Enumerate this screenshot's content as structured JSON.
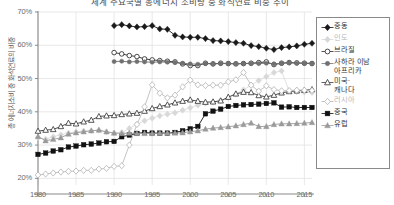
{
  "chart_data": {
    "type": "line",
    "title": "세계 주요국별 총에너지 소비량 중 화석연료 비중 추이",
    "xlabel": "",
    "ylabel": "총 에너지소비 중 화석연료의 비중",
    "xlim": [
      1980,
      2016
    ],
    "ylim": [
      0.18,
      0.7
    ],
    "ytick_labels": [
      "20%",
      "30%",
      "40%",
      "50%",
      "60%",
      "70%"
    ],
    "ytick_values": [
      20,
      30,
      40,
      50,
      60,
      70
    ],
    "xtick_labels": [
      "1980",
      "1985",
      "1990",
      "1995",
      "2000",
      "2005",
      "2010",
      "2015"
    ],
    "xtick_values": [
      1980,
      1985,
      1990,
      1995,
      2000,
      2005,
      2010,
      2015
    ],
    "grid": true,
    "legend_position": "right",
    "x": [
      1980,
      1981,
      1982,
      1983,
      1984,
      1985,
      1986,
      1987,
      1988,
      1989,
      1990,
      1991,
      1992,
      1993,
      1994,
      1995,
      1996,
      1997,
      1998,
      1999,
      2000,
      2001,
      2002,
      2003,
      2004,
      2005,
      2006,
      2007,
      2008,
      2009,
      2010,
      2011,
      2012,
      2013,
      2014,
      2015,
      2016
    ],
    "series": [
      {
        "name": "중동",
        "marker": "diamond-filled",
        "color": "#1a1a1a",
        "x": [
          1990,
          1991,
          1992,
          1993,
          1994,
          1995,
          1996,
          1997,
          1998,
          1999,
          2000,
          2001,
          2002,
          2003,
          2004,
          2005,
          2006,
          2007,
          2008,
          2009,
          2010,
          2011,
          2012,
          2013,
          2014,
          2015,
          2016
        ],
        "values": [
          65.9,
          66.2,
          65.8,
          65.5,
          65.6,
          65.9,
          64.9,
          64.8,
          63.0,
          62.5,
          62.4,
          62.4,
          62.0,
          61.4,
          61.3,
          61.1,
          60.8,
          60.6,
          59.9,
          59.6,
          59.1,
          58.7,
          59.3,
          59.5,
          59.8,
          60.3,
          60.6
        ]
      },
      {
        "name": "인도",
        "marker": "diamond-filled-light",
        "color": "#d8d8d8",
        "x": [
          1980,
          1981,
          1982,
          1983,
          1984,
          1985,
          1986,
          1987,
          1988,
          1989,
          1990,
          1991,
          1992,
          1993,
          1994,
          1995,
          1996,
          1997,
          1998,
          1999,
          2000,
          2001,
          2002,
          2003,
          2004,
          2005,
          2006,
          2007,
          2008,
          2009,
          2010,
          2011,
          2012,
          2013,
          2014,
          2015,
          2016
        ],
        "values": [
          32.2,
          31.8,
          32.5,
          33.1,
          33.6,
          34.0,
          34.2,
          34.3,
          34.4,
          33.9,
          33.6,
          33.8,
          35.0,
          36.3,
          37.3,
          38.1,
          38.8,
          39.3,
          39.7,
          40.5,
          41.2,
          42.0,
          42.6,
          42.9,
          43.4,
          44.2,
          45.3,
          46.6,
          48.0,
          49.4,
          50.6,
          51.8,
          52.3,
          46.2,
          46.0,
          45.9,
          45.8
        ]
      },
      {
        "name": "브라질",
        "marker": "circle-open",
        "color": "#2a2a2a",
        "x": [
          1990,
          1991,
          1992,
          1993,
          1994,
          1995,
          1996,
          1997,
          1998,
          1999,
          2000,
          2001,
          2002,
          2003,
          2004,
          2005,
          2006,
          2007,
          2008,
          2009,
          2010,
          2011,
          2012,
          2013,
          2014,
          2015,
          2016
        ],
        "values": [
          57.8,
          57.4,
          56.9,
          56.6,
          55.9,
          55.6,
          55.4,
          55.2,
          55.0,
          54.4,
          53.9,
          53.9,
          54.6,
          54.4,
          54.6,
          54.5,
          54.4,
          54.5,
          54.6,
          54.8,
          55.0,
          54.2,
          54.6,
          54.8,
          54.7,
          54.6,
          54.5
        ]
      },
      {
        "name": "사하라 이남\n아프리카",
        "marker": "circle-filled-gray",
        "color": "#707070",
        "x": [
          1990,
          1991,
          1992,
          1993,
          1994,
          1995,
          1996,
          1997,
          1998,
          1999,
          2000,
          2001,
          2002,
          2003,
          2004,
          2005,
          2006,
          2007,
          2008,
          2009,
          2010,
          2011,
          2012,
          2013,
          2014,
          2015,
          2016
        ],
        "values": [
          55.1,
          55.2,
          55.0,
          55.1,
          55.0,
          54.9,
          55.0,
          54.9,
          54.8,
          54.6,
          54.4,
          54.3,
          54.5,
          54.4,
          54.5,
          54.5,
          54.5,
          54.5,
          54.5,
          54.5,
          54.6,
          54.4,
          54.6,
          54.7,
          54.6,
          54.6,
          54.6
        ]
      },
      {
        "name": "미국·\n캐나다",
        "marker": "triangle-open",
        "color": "#3a3a3a",
        "x": [
          1980,
          1981,
          1982,
          1983,
          1984,
          1985,
          1986,
          1987,
          1988,
          1989,
          1990,
          1991,
          1992,
          1993,
          1994,
          1995,
          1996,
          1997,
          1998,
          1999,
          2000,
          2001,
          2002,
          2003,
          2004,
          2005,
          2006,
          2007,
          2008,
          2009,
          2010,
          2011,
          2012,
          2013,
          2014,
          2015,
          2016
        ],
        "values": [
          34.2,
          34.5,
          34.7,
          35.6,
          36.6,
          36.4,
          37.0,
          37.5,
          38.6,
          38.8,
          38.9,
          39.2,
          39.4,
          39.6,
          40.2,
          41.0,
          41.6,
          42.1,
          42.7,
          43.2,
          43.6,
          43.2,
          42.9,
          43.0,
          43.3,
          44.4,
          45.4,
          45.9,
          45.8,
          44.9,
          44.5,
          45.0,
          45.7,
          46.1,
          46.3,
          46.5,
          46.7
        ]
      },
      {
        "name": "러시아",
        "marker": "diamond-open",
        "color": "#b4b4b4",
        "x": [
          1980,
          1981,
          1982,
          1983,
          1984,
          1985,
          1986,
          1987,
          1988,
          1989,
          1990,
          1991,
          1992,
          1993,
          1994,
          1995,
          1996,
          1997,
          1998,
          1999,
          2000,
          2001,
          2002,
          2003,
          2004,
          2005,
          2006,
          2007,
          2008,
          2009,
          2010,
          2011,
          2012,
          2013,
          2014,
          2015,
          2016
        ],
        "values": [
          21.0,
          21.3,
          21.6,
          21.9,
          22.1,
          22.2,
          22.4,
          22.4,
          22.8,
          23.0,
          23.6,
          23.8,
          30.0,
          36.2,
          41.5,
          48.1,
          45.6,
          44.2,
          45.0,
          47.5,
          49.5,
          48.1,
          47.9,
          48.0,
          48.0,
          49.0,
          49.6,
          51.8,
          48.0,
          46.2,
          47.8,
          46.7,
          46.3,
          46.4,
          46.5,
          46.5,
          46.4
        ]
      },
      {
        "name": "중국",
        "marker": "square-filled",
        "color": "#111111",
        "x": [
          1980,
          1981,
          1982,
          1983,
          1984,
          1985,
          1986,
          1987,
          1988,
          1989,
          1990,
          1991,
          1992,
          1993,
          1994,
          1995,
          1996,
          1997,
          1998,
          1999,
          2000,
          2001,
          2002,
          2003,
          2004,
          2005,
          2006,
          2007,
          2008,
          2009,
          2010,
          2011,
          2012,
          2013,
          2014,
          2015,
          2016
        ],
        "values": [
          27.2,
          27.6,
          28.2,
          28.6,
          29.4,
          29.7,
          30.1,
          30.3,
          30.6,
          31.0,
          31.1,
          32.5,
          33.0,
          33.5,
          33.8,
          33.6,
          33.6,
          33.6,
          33.8,
          34.3,
          34.9,
          35.6,
          39.4,
          40.2,
          40.8,
          41.6,
          41.9,
          42.1,
          42.2,
          42.3,
          42.5,
          42.7,
          41.4,
          41.5,
          41.3,
          41.3,
          41.3
        ]
      },
      {
        "name": "유럽",
        "marker": "triangle-filled-gray",
        "color": "#9a9a9a",
        "x": [
          1980,
          1981,
          1982,
          1983,
          1984,
          1985,
          1986,
          1987,
          1988,
          1989,
          1990,
          1991,
          1992,
          1993,
          1994,
          1995,
          1996,
          1997,
          1998,
          1999,
          2000,
          2001,
          2002,
          2003,
          2004,
          2005,
          2006,
          2007,
          2008,
          2009,
          2010,
          2011,
          2012,
          2013,
          2014,
          2015,
          2016
        ],
        "values": [
          32.6,
          31.3,
          31.7,
          32.2,
          33.3,
          33.7,
          34.0,
          34.3,
          34.5,
          34.0,
          33.6,
          33.5,
          33.6,
          33.5,
          33.5,
          33.5,
          33.6,
          33.6,
          33.6,
          33.7,
          34.0,
          34.3,
          34.8,
          35.1,
          35.3,
          35.5,
          35.8,
          36.2,
          36.6,
          35.6,
          35.6,
          36.2,
          36.4,
          36.4,
          36.5,
          36.6,
          36.8
        ]
      }
    ]
  },
  "legend": {
    "items": [
      {
        "label": "중동",
        "marker": "diamond-filled"
      },
      {
        "label": "인도",
        "marker": "diamond-filled-light"
      },
      {
        "label": "브라질",
        "marker": "circle-open"
      },
      {
        "label": "사하라 이남\n아프리카",
        "marker": "circle-filled-gray"
      },
      {
        "label": "미국·\n캐나다",
        "marker": "triangle-open"
      },
      {
        "label": "러시아",
        "marker": "diamond-open"
      },
      {
        "label": "중국",
        "marker": "square-filled"
      },
      {
        "label": "유럽",
        "marker": "triangle-filled-gray"
      }
    ]
  },
  "colors": {
    "axis": "#8a8a8a",
    "grid": "#e2e2e2",
    "text": "#6b6b6b",
    "background": "#ffffff"
  }
}
